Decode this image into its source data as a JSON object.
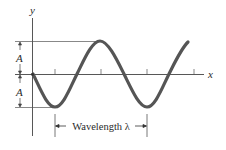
{
  "diagram": {
    "type": "wave-diagram",
    "labels": {
      "y_axis": "y",
      "x_axis": "x",
      "amplitude_upper": "A",
      "amplitude_lower": "A",
      "wavelength": "Wavelength λ"
    },
    "colors": {
      "wave": "#555555",
      "axes": "#444444",
      "text": "#2a2a2a",
      "background": "#ffffff"
    }
  }
}
